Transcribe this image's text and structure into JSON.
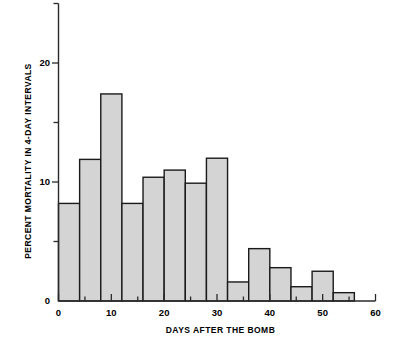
{
  "chart_data": {
    "type": "bar",
    "title": "",
    "xlabel": "DAYS AFTER THE BOMB",
    "ylabel": "PERCENT MORTALITY IN 4-DAY INTERVALS",
    "bin_width": 4,
    "bin_starts": [
      0,
      4,
      8,
      12,
      16,
      20,
      24,
      28,
      32,
      36,
      40,
      44,
      48,
      52
    ],
    "categories": [
      "0-4",
      "4-8",
      "8-12",
      "12-16",
      "16-20",
      "20-24",
      "24-28",
      "28-32",
      "32-36",
      "36-40",
      "40-44",
      "44-48",
      "48-52",
      "52-56"
    ],
    "values": [
      8.2,
      11.9,
      17.4,
      8.2,
      10.4,
      11.0,
      9.9,
      12.0,
      1.6,
      4.4,
      2.8,
      1.2,
      2.5,
      0.7
    ],
    "xlim": [
      0,
      60
    ],
    "ylim": [
      0,
      25
    ],
    "xticks_major": [
      0,
      10,
      20,
      30,
      40,
      50,
      60
    ],
    "xticks_minor": [
      5,
      15,
      25,
      35,
      45,
      55
    ],
    "xtick_labels": [
      "0",
      "10",
      "20",
      "30",
      "40",
      "50",
      "60"
    ],
    "yticks_major": [
      0,
      10,
      20
    ],
    "yticks_minor": [
      5,
      15,
      25
    ],
    "ytick_labels": [
      "0",
      "10",
      "20"
    ],
    "grid": false,
    "legend": false,
    "bar_fill_color": "#d4d4d4",
    "bar_edge_color": "#1a1a1a",
    "axis_color": "#2a2a2a",
    "background_color": "#ffffff"
  }
}
